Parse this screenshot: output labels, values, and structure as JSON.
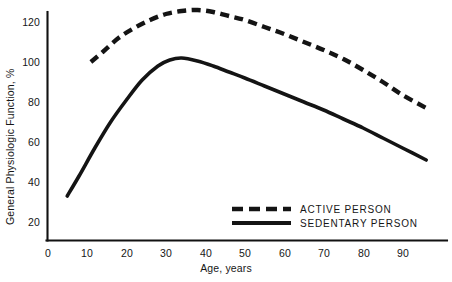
{
  "chart_data": {
    "type": "line",
    "title": "",
    "xlabel": "Age, years",
    "ylabel": "General Physiologic Function, %",
    "xlim": [
      0,
      95
    ],
    "ylim": [
      10,
      130
    ],
    "xticks": [
      0,
      10,
      20,
      30,
      40,
      50,
      60,
      70,
      80,
      90
    ],
    "yticks": [
      20,
      40,
      60,
      80,
      100,
      120
    ],
    "grid": false,
    "legend_position": "inside-lower-right",
    "series": [
      {
        "name": "ACTIVE PERSON",
        "style": "dashed",
        "color": "#141414",
        "x": [
          11,
          14,
          18,
          22,
          26,
          30,
          34,
          38,
          42,
          46,
          50,
          55,
          60,
          65,
          70,
          75,
          80,
          85,
          90,
          96
        ],
        "y": [
          100,
          105,
          112,
          117,
          121,
          124,
          125.5,
          126,
          125,
          123,
          121,
          117.5,
          114,
          110,
          106,
          101.5,
          96,
          90,
          83.5,
          77
        ]
      },
      {
        "name": "SEDENTARY PERSON",
        "style": "solid",
        "color": "#141414",
        "x": [
          5,
          8,
          12,
          16,
          20,
          24,
          28,
          31,
          34,
          38,
          42,
          46,
          50,
          55,
          60,
          65,
          70,
          75,
          80,
          85,
          90,
          96
        ],
        "y": [
          33,
          43,
          57,
          70,
          81,
          91,
          98,
          101,
          102,
          100.5,
          98,
          95,
          92,
          88,
          84,
          80,
          76,
          71.5,
          67,
          62,
          57,
          51
        ]
      }
    ]
  },
  "axes": {
    "y_title": "General Physiologic Function, %",
    "x_title": "Age, years",
    "y_tick_labels": [
      "120",
      "100",
      "80",
      "60",
      "40",
      "20"
    ],
    "x_tick_labels": [
      "0",
      "10",
      "20",
      "30",
      "40",
      "50",
      "60",
      "70",
      "80",
      "90"
    ]
  },
  "legend": {
    "items": [
      {
        "label": "ACTIVE PERSON",
        "style": "dashed"
      },
      {
        "label": "SEDENTARY PERSON",
        "style": "solid"
      }
    ]
  },
  "colors": {
    "series": "#141414",
    "axis": "#111111",
    "background": "#ffffff",
    "text": "#161616"
  }
}
